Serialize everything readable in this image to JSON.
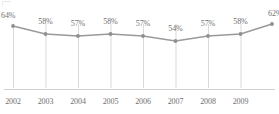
{
  "chart_data": {
    "type": "line",
    "title": "",
    "subtitle": "",
    "xlabel": "",
    "ylabel": "",
    "grid": "vertical-only",
    "legend": "none",
    "categories": [
      "2002",
      "2003",
      "2004",
      "2005",
      "2006",
      "2007",
      "2008",
      "2009",
      ""
    ],
    "tick_labels": [
      "2002",
      "2003",
      "2004",
      "2005",
      "2006",
      "2007",
      "2008",
      "2009"
    ],
    "values": [
      64,
      58,
      57,
      58,
      57,
      54,
      57,
      58,
      62
    ],
    "point_labels": [
      "64%",
      "58%",
      "57%",
      "58%",
      "57%",
      "54%",
      "57%",
      "58%",
      "62%"
    ],
    "ylim": [
      0,
      70
    ],
    "series": [
      {
        "name": "",
        "values": [
          64,
          58,
          57,
          58,
          57,
          54,
          57,
          58,
          62
        ],
        "labels": [
          "64%",
          "58%",
          "57%",
          "58%",
          "57%",
          "54%",
          "57%",
          "58%",
          "62%"
        ],
        "color": "#9a9a9a",
        "marker": "circle",
        "marker_color": "#8f8f8f"
      }
    ],
    "colors": {
      "line": "#9a9a9a",
      "marker": "#8f8f8f",
      "gridline": "#d9d9d9",
      "axis": "#d0d0d0",
      "label_text": "#6f6f6f",
      "background": "#ffffff"
    },
    "geometry": {
      "point_x": [
        13,
        45.5,
        78,
        110.5,
        143,
        175.5,
        208,
        240.5,
        272
      ],
      "point_y": [
        26,
        34,
        36,
        34,
        36,
        41,
        36,
        34,
        24
      ],
      "gridline_x": [
        13,
        45.5,
        78,
        110.5,
        143,
        175.5,
        208,
        240.5
      ],
      "gridline_top": 24,
      "gridline_bottom": 88,
      "baseline_y": 89
    },
    "label_offsets": [
      {
        "x": 13,
        "y": 11,
        "align": "left"
      },
      {
        "x": 45.5,
        "y": 17
      },
      {
        "x": 78,
        "y": 19
      },
      {
        "x": 110.5,
        "y": 17
      },
      {
        "x": 143,
        "y": 19
      },
      {
        "x": 175.5,
        "y": 24
      },
      {
        "x": 208,
        "y": 19
      },
      {
        "x": 240.5,
        "y": 17
      },
      {
        "x": 268,
        "y": 9,
        "align": "right"
      }
    ]
  }
}
